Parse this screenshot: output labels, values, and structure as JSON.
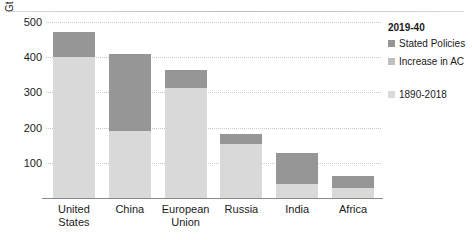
{
  "chart_data": {
    "type": "bar",
    "stacked": true,
    "title": "",
    "xlabel": "",
    "ylabel": "Gt",
    "ylim": [
      0,
      500
    ],
    "yticks": [
      500,
      400,
      300,
      200,
      100
    ],
    "grid": true,
    "legend_position": "right",
    "legend_title": "2019-40",
    "categories": [
      "United States",
      "China",
      "European Union",
      "Russia",
      "India",
      "Africa"
    ],
    "series": [
      {
        "name": "1890-2018",
        "color": "#d9d9d9",
        "values": [
          400,
          190,
          313,
          153,
          40,
          28
        ]
      },
      {
        "name": "Increase in AC",
        "color": "#bfbfbf",
        "values": [
          0,
          0,
          0,
          0,
          0,
          0
        ]
      },
      {
        "name": "Stated Policies",
        "color": "#969696",
        "values": [
          71,
          219,
          51,
          29,
          88,
          35
        ]
      }
    ],
    "totals": [
      471,
      409,
      364,
      182,
      128,
      63
    ]
  },
  "axis": {
    "unit_label": "Gt",
    "tick_labels": [
      "500",
      "400",
      "300",
      "200",
      "100"
    ]
  },
  "categories": [
    {
      "line1": "United",
      "line2": "States"
    },
    {
      "line1": "China",
      "line2": ""
    },
    {
      "line1": "European",
      "line2": "Union"
    },
    {
      "line1": "Russia",
      "line2": ""
    },
    {
      "line1": "India",
      "line2": ""
    },
    {
      "line1": "Africa",
      "line2": ""
    }
  ],
  "legend": {
    "title": "2019-40",
    "items": [
      {
        "label": "Stated Policies",
        "color": "#969696"
      },
      {
        "label": "Increase in AC",
        "color": "#bfbfbf"
      },
      {
        "label": "1890-2018",
        "color": "#d9d9d9"
      }
    ]
  }
}
